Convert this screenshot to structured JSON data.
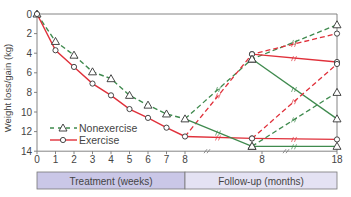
{
  "chart_data": {
    "type": "line",
    "title": "",
    "ylabel": "Weight loss/gain (kg)",
    "xlabel": "",
    "ylim": [
      0,
      14
    ],
    "y_inverted": true,
    "yticks": [
      0,
      2,
      4,
      6,
      8,
      10,
      12,
      14
    ],
    "xticks_treatment": [
      "0",
      "1",
      "2",
      "3",
      "4",
      "5",
      "6",
      "7",
      "8"
    ],
    "xticks_followup": [
      "8",
      "18"
    ],
    "phases": [
      {
        "label": "Treatment (weeks)",
        "color": "#cac7e7"
      },
      {
        "label": "Follow-up (months)",
        "color": "#e4e2f3"
      }
    ],
    "legend": [
      {
        "name": "Nonexercise",
        "marker": "triangle",
        "style": "dashed",
        "color": "#3f8a4e"
      },
      {
        "name": "Exercise",
        "marker": "circle",
        "style": "solid",
        "color": "#e0303a"
      }
    ],
    "treatment_weeks": [
      0,
      1,
      2,
      3,
      4,
      5,
      6,
      7,
      8
    ],
    "series": [
      {
        "name": "Nonexercise",
        "values": [
          0,
          2.8,
          4.2,
          5.9,
          6.6,
          8.3,
          9.3,
          10.2,
          10.7
        ]
      },
      {
        "name": "Exercise",
        "values": [
          0,
          3.7,
          5.4,
          7.1,
          8.3,
          9.7,
          10.6,
          11.6,
          12.5
        ]
      }
    ],
    "followup_paths": [
      {
        "group": "Nonexercise",
        "style": "dashed",
        "points": [
          [
            "wk8",
            10.7
          ],
          [
            "m8",
            4.6
          ],
          [
            "m18",
            1.1
          ]
        ]
      },
      {
        "group": "Exercise",
        "style": "dashed",
        "points": [
          [
            "wk8",
            12.5
          ],
          [
            "m8",
            4.1
          ],
          [
            "m18",
            2.0
          ]
        ]
      },
      {
        "group": "Exercise",
        "style": "solid",
        "points": [
          [
            "m8",
            4.1
          ],
          [
            "m18",
            4.9
          ]
        ]
      },
      {
        "group": "Nonexercise",
        "style": "solid",
        "points": [
          [
            "m8",
            4.6
          ],
          [
            "m18",
            10.7
          ]
        ]
      },
      {
        "group": "Exercise",
        "style": "solid",
        "points": [
          [
            "wk8",
            12.5
          ],
          [
            "m8",
            12.7
          ],
          [
            "m18",
            12.8
          ]
        ]
      },
      {
        "group": "Nonexercise",
        "style": "solid",
        "points": [
          [
            "wk8",
            10.7
          ],
          [
            "m8",
            13.5
          ],
          [
            "m18",
            13.5
          ]
        ]
      },
      {
        "group": "Exercise",
        "style": "dashed",
        "points": [
          [
            "m8",
            12.7
          ],
          [
            "m18",
            5.1
          ]
        ]
      },
      {
        "group": "Nonexercise",
        "style": "dashed",
        "points": [
          [
            "m8",
            13.5
          ],
          [
            "m18",
            8.0
          ]
        ]
      }
    ],
    "grid": false
  },
  "legend_labels": {
    "nonexercise": "Nonexercise",
    "exercise": "Exercise"
  },
  "axis": {
    "ylabel": "Weight loss/gain (kg)"
  },
  "phase_labels": {
    "treatment": "Treatment (weeks)",
    "followup": "Follow-up (months)"
  }
}
